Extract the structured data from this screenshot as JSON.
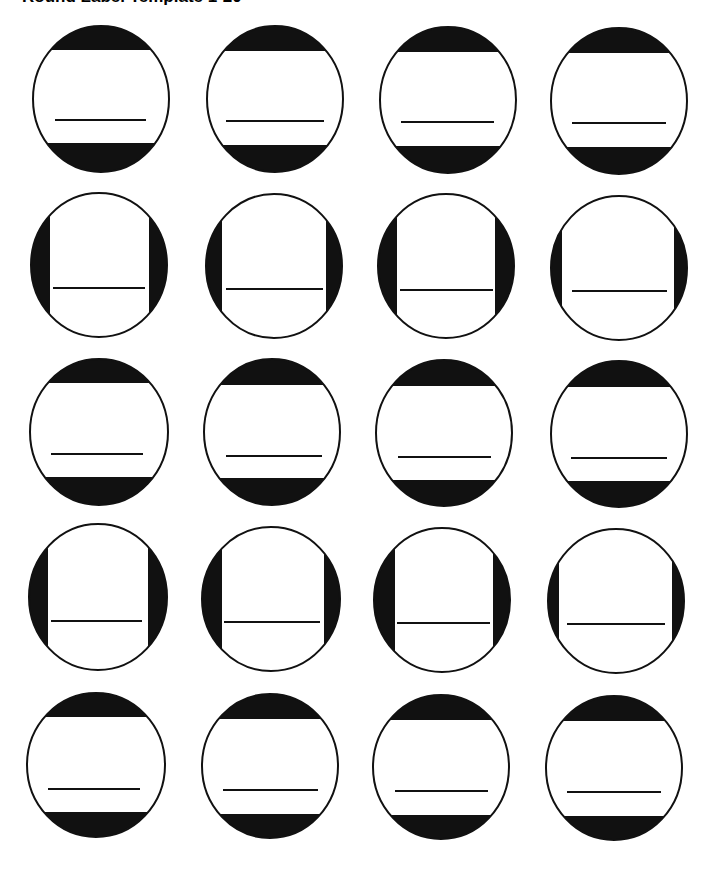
{
  "page": {
    "title": "Round Label Template 1-20"
  },
  "style": {
    "ink": "#111111",
    "paper": "#ffffff",
    "outline_width": 2,
    "writing_line_width": 2
  },
  "labels": [
    {
      "id": 1,
      "cx": 101,
      "cy": 99,
      "rx": 68,
      "ry": 73,
      "bands": "horizontal",
      "band_a": 50,
      "band_b": 143,
      "line_y": 120,
      "line_x1": 55,
      "line_x2": 146
    },
    {
      "id": 2,
      "cx": 275,
      "cy": 99,
      "rx": 68,
      "ry": 73,
      "bands": "horizontal",
      "band_a": 51,
      "band_b": 145,
      "line_y": 121,
      "line_x1": 226,
      "line_x2": 324
    },
    {
      "id": 3,
      "cx": 448,
      "cy": 100,
      "rx": 68,
      "ry": 73,
      "bands": "horizontal",
      "band_a": 52,
      "band_b": 146,
      "line_y": 122,
      "line_x1": 401,
      "line_x2": 494
    },
    {
      "id": 4,
      "cx": 619,
      "cy": 101,
      "rx": 68,
      "ry": 73,
      "bands": "horizontal",
      "band_a": 53,
      "band_b": 147,
      "line_y": 123,
      "line_x1": 572,
      "line_x2": 666
    },
    {
      "id": 5,
      "cx": 99,
      "cy": 265,
      "rx": 68,
      "ry": 72,
      "bands": "vertical",
      "band_a": 50,
      "band_b": 149,
      "line_y": 288,
      "line_x1": 53,
      "line_x2": 145
    },
    {
      "id": 6,
      "cx": 274,
      "cy": 266,
      "rx": 68,
      "ry": 72,
      "bands": "vertical",
      "band_a": 222,
      "band_b": 326,
      "line_y": 289,
      "line_x1": 226,
      "line_x2": 323
    },
    {
      "id": 7,
      "cx": 446,
      "cy": 266,
      "rx": 68,
      "ry": 72,
      "bands": "vertical",
      "band_a": 397,
      "band_b": 495,
      "line_y": 290,
      "line_x1": 400,
      "line_x2": 493
    },
    {
      "id": 8,
      "cx": 619,
      "cy": 268,
      "rx": 68,
      "ry": 72,
      "bands": "vertical",
      "band_a": 562,
      "band_b": 674,
      "line_y": 291,
      "line_x1": 572,
      "line_x2": 667
    },
    {
      "id": 9,
      "cx": 99,
      "cy": 432,
      "rx": 69,
      "ry": 73,
      "bands": "horizontal",
      "band_a": 383,
      "band_b": 477,
      "line_y": 454,
      "line_x1": 51,
      "line_x2": 143
    },
    {
      "id": 10,
      "cx": 272,
      "cy": 432,
      "rx": 68,
      "ry": 73,
      "bands": "horizontal",
      "band_a": 385,
      "band_b": 478,
      "line_y": 456,
      "line_x1": 226,
      "line_x2": 322
    },
    {
      "id": 11,
      "cx": 444,
      "cy": 433,
      "rx": 68,
      "ry": 73,
      "bands": "horizontal",
      "band_a": 386,
      "band_b": 480,
      "line_y": 457,
      "line_x1": 398,
      "line_x2": 491
    },
    {
      "id": 12,
      "cx": 619,
      "cy": 434,
      "rx": 68,
      "ry": 73,
      "bands": "horizontal",
      "band_a": 387,
      "band_b": 481,
      "line_y": 458,
      "line_x1": 571,
      "line_x2": 667
    },
    {
      "id": 13,
      "cx": 98,
      "cy": 597,
      "rx": 69,
      "ry": 73,
      "bands": "vertical",
      "band_a": 48,
      "band_b": 148,
      "line_y": 621,
      "line_x1": 51,
      "line_x2": 142
    },
    {
      "id": 14,
      "cx": 271,
      "cy": 599,
      "rx": 69,
      "ry": 72,
      "bands": "vertical",
      "band_a": 222,
      "band_b": 324,
      "line_y": 622,
      "line_x1": 224,
      "line_x2": 320
    },
    {
      "id": 15,
      "cx": 442,
      "cy": 600,
      "rx": 68,
      "ry": 72,
      "bands": "vertical",
      "band_a": 395,
      "band_b": 493,
      "line_y": 623,
      "line_x1": 397,
      "line_x2": 490
    },
    {
      "id": 16,
      "cx": 616,
      "cy": 601,
      "rx": 68,
      "ry": 72,
      "bands": "vertical",
      "band_a": 559,
      "band_b": 672,
      "line_y": 624,
      "line_x1": 567,
      "line_x2": 665
    },
    {
      "id": 17,
      "cx": 96,
      "cy": 765,
      "rx": 69,
      "ry": 72,
      "bands": "horizontal",
      "band_a": 717,
      "band_b": 812,
      "line_y": 789,
      "line_x1": 48,
      "line_x2": 140
    },
    {
      "id": 18,
      "cx": 270,
      "cy": 766,
      "rx": 68,
      "ry": 72,
      "bands": "horizontal",
      "band_a": 719,
      "band_b": 814,
      "line_y": 790,
      "line_x1": 223,
      "line_x2": 318
    },
    {
      "id": 19,
      "cx": 441,
      "cy": 767,
      "rx": 68,
      "ry": 72,
      "bands": "horizontal",
      "band_a": 720,
      "band_b": 815,
      "line_y": 791,
      "line_x1": 395,
      "line_x2": 488
    },
    {
      "id": 20,
      "cx": 614,
      "cy": 768,
      "rx": 68,
      "ry": 72,
      "bands": "horizontal",
      "band_a": 721,
      "band_b": 816,
      "line_y": 792,
      "line_x1": 567,
      "line_x2": 661
    }
  ]
}
